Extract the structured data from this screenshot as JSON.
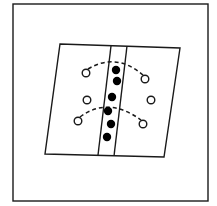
{
  "figure": {
    "description": "Schematic: a sheared parallelogram with a central slanted band containing a column of filled dots, flanked by open circles connected by two dashed arcs",
    "colors": {
      "background": "#ffffff",
      "stroke": "#1a1a1a",
      "filled_dot": "#000000",
      "open_circle_fill": "#ffffff"
    },
    "frame": {
      "x": 13,
      "y": 4,
      "width": 195,
      "height": 197
    },
    "parallelogram": {
      "points": [
        [
          60,
          44
        ],
        [
          180,
          48
        ],
        [
          164,
          157
        ],
        [
          45,
          154
        ]
      ]
    },
    "band": {
      "left_line": [
        [
          111,
          46
        ],
        [
          98,
          155
        ]
      ],
      "right_line": [
        [
          127,
          46
        ],
        [
          114,
          156
        ]
      ]
    },
    "filled_dots": [
      {
        "cx": 116,
        "cy": 70,
        "r": 4.2
      },
      {
        "cx": 117,
        "cy": 81,
        "r": 4.2
      },
      {
        "cx": 112,
        "cy": 97,
        "r": 4.2
      },
      {
        "cx": 108,
        "cy": 111,
        "r": 4.2
      },
      {
        "cx": 111,
        "cy": 124,
        "r": 4.2
      },
      {
        "cx": 107,
        "cy": 137,
        "r": 4.2
      }
    ],
    "open_circles": [
      {
        "cx": 86,
        "cy": 73,
        "r": 3.8
      },
      {
        "cx": 145,
        "cy": 79,
        "r": 3.8
      },
      {
        "cx": 87,
        "cy": 100,
        "r": 3.8
      },
      {
        "cx": 151,
        "cy": 100,
        "r": 3.8
      },
      {
        "cx": 78,
        "cy": 121,
        "r": 3.8
      },
      {
        "cx": 143,
        "cy": 124,
        "r": 3.8
      }
    ],
    "dashed_arcs": [
      {
        "d": "M 88 69 Q 116 52 143 75"
      },
      {
        "d": "M 80 117 Q 108 96 141 120"
      }
    ]
  }
}
